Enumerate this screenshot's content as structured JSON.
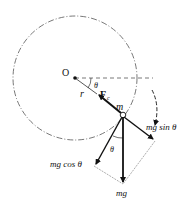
{
  "diagram": {
    "type": "free-body diagram, vertical circular motion",
    "labels": {
      "center": "O",
      "radius": "r",
      "angle_top": "θ",
      "angle_bottom": "θ",
      "force_c": "F",
      "force_c_sub": "c",
      "mass": "m",
      "mg_sin": "mg sin θ",
      "mg_cos": "mg cos θ",
      "mg": "mg"
    },
    "colors": {
      "stroke": "#111111",
      "dashed": "#555555",
      "background": "#ffffff"
    }
  }
}
